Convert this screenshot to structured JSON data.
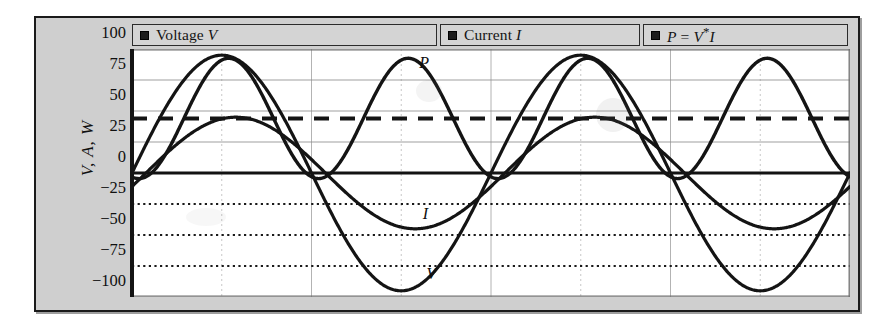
{
  "figure": {
    "background_color": "#ffffff",
    "frame_color": "#cfcfcf",
    "plot_background": "#ffffff",
    "ink_color": "#141414"
  },
  "legend": {
    "position": "top",
    "entries": [
      {
        "marker": "square-marker-icon",
        "label": "Voltage V",
        "text_plain": "Voltage V"
      },
      {
        "marker": "square-marker-icon",
        "label": "Current I",
        "text_plain": "Current I"
      },
      {
        "marker": "square-marker-icon",
        "label": "P = V*I",
        "text_plain": "P = V*I"
      }
    ]
  },
  "axes": {
    "ylabel": "V, A, W",
    "yticks": [
      100,
      75,
      50,
      25,
      0,
      -25,
      -50,
      -75,
      -100
    ],
    "ytick_labels": [
      "100",
      "75",
      "50",
      "25",
      "0",
      "−25",
      "−50",
      "−75",
      "−100"
    ],
    "ylim": [
      -100,
      100
    ],
    "xlim": [
      0,
      2
    ],
    "xticks": [],
    "xtick_labels": [],
    "xlabel": "",
    "grid": "horizontal and vertical"
  },
  "annotations": [
    {
      "text": "P",
      "series": "power",
      "x_pct": 40.0,
      "y_value": 88
    },
    {
      "text": "I",
      "series": "current",
      "x_pct": 40.5,
      "y_value": -34
    },
    {
      "text": "V",
      "series": "voltage",
      "x_pct": 41.0,
      "y_value": -82
    }
  ],
  "chart_data": {
    "type": "line",
    "title": "",
    "subtitle": "",
    "xlabel": "",
    "ylabel": "V, A, W",
    "xlim": [
      0,
      2
    ],
    "ylim": [
      -100,
      100
    ],
    "yticks": [
      -100,
      -75,
      -50,
      -25,
      0,
      25,
      50,
      75,
      100
    ],
    "grid": true,
    "legend_position": "top",
    "series": [
      {
        "name": "Voltage V",
        "waveform": "sine",
        "amplitude": 95,
        "cycles": 2,
        "phase_deg": 0,
        "offset": 0,
        "linestyle": "solid",
        "linewidth": 3.2,
        "color": "#141414",
        "peak": 95,
        "trough": -95
      },
      {
        "name": "Current I",
        "waveform": "sine",
        "amplitude": 45,
        "cycles": 2,
        "phase_deg": -14,
        "offset": 0,
        "linestyle": "solid",
        "linewidth": 3.2,
        "color": "#141414",
        "peak": 45,
        "trough": -45
      },
      {
        "name": "P = V*I",
        "waveform": "raised-sine-squared",
        "amplitude": 48.5,
        "cycles": 4,
        "phase_deg": -14,
        "offset": 44,
        "linestyle": "solid",
        "linewidth": 3.4,
        "color": "#141414",
        "peak": 97,
        "trough": -4
      }
    ],
    "reference_lines": [
      {
        "name": "average power",
        "orientation": "horizontal",
        "value": 44,
        "linestyle": "dashed",
        "linewidth": 4,
        "color": "#141414"
      }
    ],
    "gridlines": {
      "solid_light": [
        75,
        50,
        25
      ],
      "dotted": [
        -25,
        -50,
        -75
      ],
      "axis_line": 0,
      "vertical_count": 8
    }
  }
}
